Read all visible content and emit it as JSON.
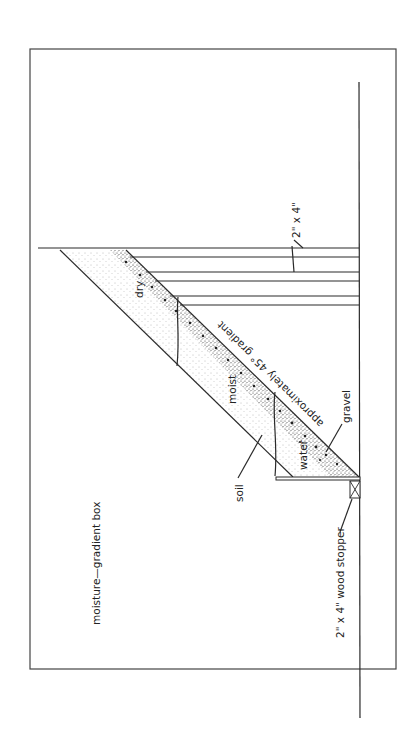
{
  "diagram": {
    "title": "moisture—gradient box",
    "labels": {
      "board": "2\" x 4\"",
      "stopper": "2\" x 4\" wood stopper",
      "gradient": "approximately 45° gradient",
      "dry": "dry",
      "moist": "moist",
      "water": "water",
      "soil": "soil",
      "gravel": "gravel"
    },
    "colors": {
      "line": "#2a2a2a",
      "frame": "#444444",
      "background": "#ffffff",
      "stipple": "#555555"
    }
  }
}
